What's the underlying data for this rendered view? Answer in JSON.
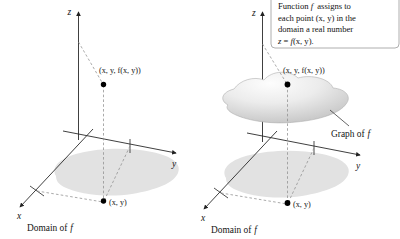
{
  "figure": {
    "background_color": "#ffffff",
    "ink_color": "#161616",
    "dash_color": "#8d8d8d",
    "domain_fill": "#e2e2e2",
    "surface_fill_light": "#fbfbfb",
    "surface_fill_dark": "#c9c9c9"
  },
  "panels": [
    {
      "id": "left",
      "name": "domain-only-panel",
      "caption": "Domain of f",
      "caption_plain": "Domain of",
      "caption_italic": "f",
      "axes": [
        {
          "name": "z-axis",
          "label": "z"
        },
        {
          "name": "y-axis",
          "label": "y"
        },
        {
          "name": "x-axis",
          "label": "x"
        }
      ],
      "points": [
        {
          "name": "surface-point",
          "label": "(x, y, f(x, y))"
        },
        {
          "name": "domain-point",
          "label": "(x, y)"
        }
      ]
    },
    {
      "id": "right",
      "name": "graph-panel",
      "caption": "Domain of f",
      "caption_plain": "Domain of",
      "caption_italic": "f",
      "graph_label_plain": "Graph of",
      "graph_label_italic": "f",
      "graph_label": "Graph of f",
      "axes": [
        {
          "name": "z-axis",
          "label": "z"
        },
        {
          "name": "y-axis",
          "label": "y"
        },
        {
          "name": "x-axis",
          "label": "x"
        }
      ],
      "points": [
        {
          "name": "surface-point",
          "label": "(x, y, f(x, y))"
        },
        {
          "name": "domain-point",
          "label": "(x, y)"
        }
      ]
    }
  ],
  "callout": {
    "name": "function-description-callout",
    "lines": [
      "Function f assigns to",
      "each point (x, y) in the",
      "domain a real number",
      "z = f(x, y)."
    ],
    "line1_a": "Function ",
    "line1_f": "f",
    "line1_b": " assigns to",
    "line2": "each point (x, y) in the",
    "line3": "domain a real number",
    "line4_z": "z",
    "line4_eq": " = ",
    "line4_f": "f",
    "line4_rest": "(x, y)."
  }
}
